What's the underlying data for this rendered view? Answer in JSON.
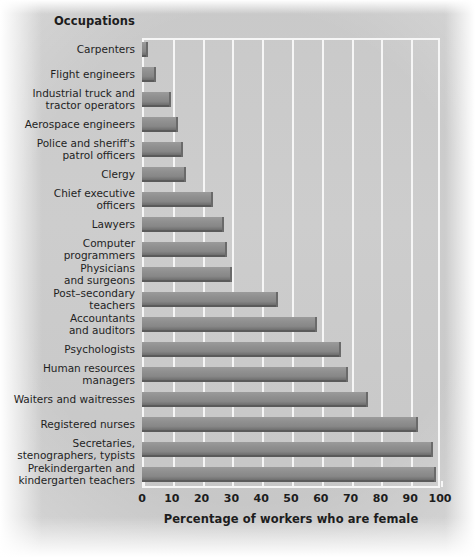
{
  "header": {
    "occupations_title": "Occupations"
  },
  "axis": {
    "x_title": "Percentage of workers who are female",
    "x_ticks": [
      "0",
      "10",
      "20",
      "30",
      "40",
      "50",
      "60",
      "70",
      "80",
      "90",
      "100"
    ]
  },
  "colors": {
    "bar_fill": "#8d8d8d",
    "bar_edge": "#5a5a5a",
    "background": "#cacaca",
    "gridline": "#f6f6f6",
    "text": "#1d1d1d"
  },
  "chart_data": {
    "type": "bar",
    "orientation": "horizontal",
    "title": "Occupations",
    "xlabel": "Percentage of workers who are female",
    "ylabel": "Occupations",
    "xlim": [
      0,
      100
    ],
    "grid": true,
    "legend": "none",
    "categories": [
      "Carpenters",
      "Flight engineers",
      "Industrial truck and tractor operators",
      "Aerospace engineers",
      "Police and sheriff's patrol officers",
      "Clergy",
      "Chief executive officers",
      "Lawyers",
      "Computer programmers",
      "Physicians and surgeons",
      "Post-secondary teachers",
      "Accountants and auditors",
      "Psychologists",
      "Human resources managers",
      "Waiters and waitresses",
      "Registered nurses",
      "Secretaries, stenographers, typists",
      "Prekindergarten and kindergarten teachers"
    ],
    "category_lines": [
      [
        "Carpenters"
      ],
      [
        "Flight engineers"
      ],
      [
        "Industrial truck and",
        "tractor operators"
      ],
      [
        "Aerospace engineers"
      ],
      [
        "Police and sheriff's",
        "patrol officers"
      ],
      [
        "Clergy"
      ],
      [
        "Chief executive",
        "officers"
      ],
      [
        "Lawyers"
      ],
      [
        "Computer",
        "programmers"
      ],
      [
        "Physicians",
        "and surgeons"
      ],
      [
        "Post–secondary",
        "teachers"
      ],
      [
        "Accountants",
        "and auditors"
      ],
      [
        "Psychologists"
      ],
      [
        "Human resources",
        "managers"
      ],
      [
        "Waiters and waitresses"
      ],
      [
        "Registered nurses"
      ],
      [
        "Secretaries,",
        "stenographers, typists"
      ],
      [
        "Prekindergarten and",
        "kindergarten teachers"
      ]
    ],
    "values": [
      1.5,
      4,
      9,
      11.5,
      13,
      14,
      23,
      27,
      28,
      29.5,
      45,
      58,
      66,
      68.5,
      75,
      92,
      97,
      98
    ]
  }
}
